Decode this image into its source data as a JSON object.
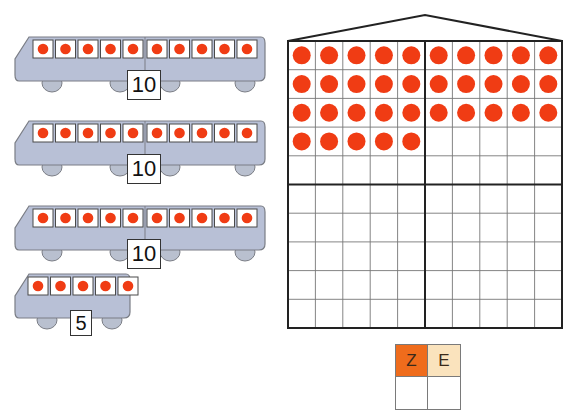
{
  "colors": {
    "dot": "#f03c14",
    "bus_body": "#b8c0d6",
    "bus_outline": "#7a7d85",
    "grid_line": "#777777",
    "grid_border": "#222222",
    "tens_header": "#ef6c1c",
    "ones_header": "#fae3bd"
  },
  "buses": [
    {
      "label": "10",
      "seats": 10,
      "type": "double"
    },
    {
      "label": "10",
      "seats": 10,
      "type": "double"
    },
    {
      "label": "10",
      "seats": 10,
      "type": "double"
    },
    {
      "label": "5",
      "seats": 5,
      "type": "single"
    }
  ],
  "grid": {
    "rows": 10,
    "cols": 10,
    "filled_rows": [
      10,
      10,
      10,
      5
    ],
    "total_dots": 35
  },
  "place_value_table": {
    "headers": [
      "Z",
      "E"
    ],
    "values": [
      "",
      ""
    ]
  }
}
